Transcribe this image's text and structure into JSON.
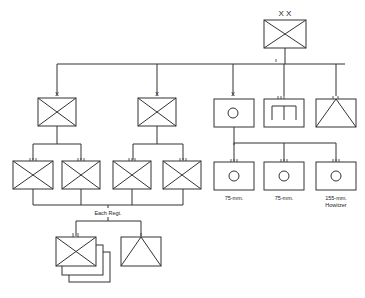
{
  "diagram": {
    "type": "military-organization-chart",
    "division": {
      "echelon": "X X",
      "symbol": "infantry"
    },
    "brigades": [
      {
        "echelon": "X",
        "symbol": "infantry",
        "regiments": [
          {
            "echelon": "III",
            "symbol": "infantry"
          },
          {
            "echelon": "III",
            "symbol": "infantry"
          }
        ]
      },
      {
        "echelon": "X",
        "symbol": "infantry",
        "regiments": [
          {
            "echelon": "III",
            "symbol": "infantry"
          },
          {
            "echelon": "III",
            "symbol": "infantry"
          }
        ]
      }
    ],
    "artillery_brigade": {
      "echelon": "X",
      "symbol": "artillery",
      "regiments": [
        {
          "echelon": "III",
          "symbol": "artillery",
          "label": "75-mm."
        },
        {
          "echelon": "III",
          "symbol": "artillery",
          "label": "75-mm."
        },
        {
          "echelon": "III",
          "symbol": "artillery",
          "label": "155-mm. Howitzer",
          "label_lines": [
            "155-mm.",
            "Howitzer"
          ]
        }
      ]
    },
    "engineer_regiment": {
      "echelon": "III",
      "symbol": "engineer"
    },
    "signal_unit": {
      "echelon": "II",
      "symbol": "signal"
    },
    "each_regiment": {
      "label": "Each Regt.",
      "units": [
        {
          "echelon": "II",
          "symbol": "infantry",
          "count": 3
        },
        {
          "echelon": "I",
          "symbol": "signal"
        }
      ]
    }
  }
}
